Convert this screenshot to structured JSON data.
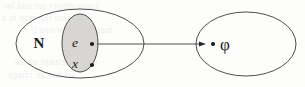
{
  "diagram": {
    "type": "set-mapping-diagram",
    "canvas": {
      "width": 305,
      "height": 87,
      "background": "#fdfdfc"
    },
    "stroke_color": "#3a3a3a",
    "fill_shaded": "#d8d6d4",
    "text_color": "#1c1c1c",
    "outer_set": {
      "label": "N",
      "label_x": 39,
      "label_y": 48,
      "cx": 80,
      "cy": 43.5,
      "rx": 64,
      "ry": 34.5
    },
    "inner_set": {
      "label": "",
      "cx": 80,
      "cy": 43,
      "rx": 18,
      "ry": 29,
      "fill": "#d8d6d4"
    },
    "target_set": {
      "cx": 246,
      "cy": 44,
      "rx": 50,
      "ry": 32
    },
    "points": [
      {
        "label": "e",
        "label_x": 75,
        "label_y": 47,
        "dot_x": 92,
        "dot_y": 44,
        "dot_r": 2.1
      },
      {
        "label": "x",
        "label_x": 75,
        "label_y": 68,
        "dot_x": 92,
        "dot_y": 65,
        "dot_r": 2.1
      },
      {
        "label": "φ",
        "label_x": 220,
        "label_y": 50,
        "dot_x": 213,
        "dot_y": 44,
        "dot_r": 2.1
      }
    ],
    "arrow": {
      "x1": 97,
      "y1": 44,
      "x2": 206,
      "y2": 44,
      "head_length": 7,
      "head_width": 5
    },
    "background_ghost_text": {
      "visible": true,
      "lines": [
        "a non-empty set and let",
        "this case the map is a",
        "map is one-to-one if",
        "every element of the",
        "set has an image"
      ]
    }
  }
}
